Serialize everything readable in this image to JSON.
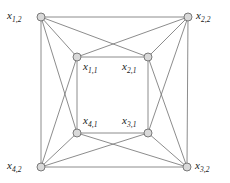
{
  "figure": {
    "kind": "graph-diagram",
    "title": "",
    "background_color": "#ffffff",
    "edge_color": "#6e6e6e",
    "node_fill_color": "#d9d9d9",
    "node_stroke_color": "#6e6e6e",
    "label_color": "#1a1a1a"
  },
  "nodes": [
    {
      "id": "x1_2",
      "base": "x",
      "sub": "1,2",
      "x": 41,
      "y": 17,
      "ring": "outer",
      "corner": "top-left"
    },
    {
      "id": "x2_2",
      "base": "x",
      "sub": "2,2",
      "x": 188,
      "y": 17,
      "ring": "outer",
      "corner": "top-right"
    },
    {
      "id": "x3_2",
      "base": "x",
      "sub": "3,2",
      "x": 187,
      "y": 167,
      "ring": "outer",
      "corner": "bottom-right"
    },
    {
      "id": "x4_2",
      "base": "x",
      "sub": "4,2",
      "x": 41,
      "y": 167,
      "ring": "outer",
      "corner": "bottom-left"
    },
    {
      "id": "x1_1",
      "base": "x",
      "sub": "1,1",
      "x": 77,
      "y": 57,
      "ring": "inner",
      "corner": "top-left"
    },
    {
      "id": "x2_1",
      "base": "x",
      "sub": "2,1",
      "x": 148,
      "y": 57,
      "ring": "inner",
      "corner": "top-right"
    },
    {
      "id": "x3_1",
      "base": "x",
      "sub": "3,1",
      "x": 148,
      "y": 133,
      "ring": "inner",
      "corner": "bottom-right"
    },
    {
      "id": "x4_1",
      "base": "x",
      "sub": "4,1",
      "x": 77,
      "y": 133,
      "ring": "inner",
      "corner": "bottom-left"
    }
  ],
  "edges": [
    {
      "from": "x1_2",
      "to": "x2_2",
      "kind": "outer-square"
    },
    {
      "from": "x2_2",
      "to": "x3_2",
      "kind": "outer-square"
    },
    {
      "from": "x3_2",
      "to": "x4_2",
      "kind": "outer-square"
    },
    {
      "from": "x4_2",
      "to": "x1_2",
      "kind": "outer-square"
    },
    {
      "from": "x1_1",
      "to": "x2_1",
      "kind": "inner-square"
    },
    {
      "from": "x2_1",
      "to": "x3_1",
      "kind": "inner-square"
    },
    {
      "from": "x3_1",
      "to": "x4_1",
      "kind": "inner-square"
    },
    {
      "from": "x4_1",
      "to": "x1_1",
      "kind": "inner-square"
    },
    {
      "from": "x1_2",
      "to": "x1_1",
      "kind": "spoke"
    },
    {
      "from": "x2_2",
      "to": "x2_1",
      "kind": "spoke"
    },
    {
      "from": "x3_2",
      "to": "x3_1",
      "kind": "spoke"
    },
    {
      "from": "x4_2",
      "to": "x4_1",
      "kind": "spoke"
    },
    {
      "from": "x1_2",
      "to": "x2_1",
      "kind": "cross-top"
    },
    {
      "from": "x2_2",
      "to": "x1_1",
      "kind": "cross-top"
    },
    {
      "from": "x2_2",
      "to": "x3_1",
      "kind": "cross-right"
    },
    {
      "from": "x3_2",
      "to": "x2_1",
      "kind": "cross-right"
    },
    {
      "from": "x3_2",
      "to": "x4_1",
      "kind": "cross-bottom"
    },
    {
      "from": "x4_2",
      "to": "x3_1",
      "kind": "cross-bottom"
    },
    {
      "from": "x4_2",
      "to": "x1_1",
      "kind": "cross-left"
    },
    {
      "from": "x1_2",
      "to": "x4_1",
      "kind": "cross-left"
    }
  ]
}
